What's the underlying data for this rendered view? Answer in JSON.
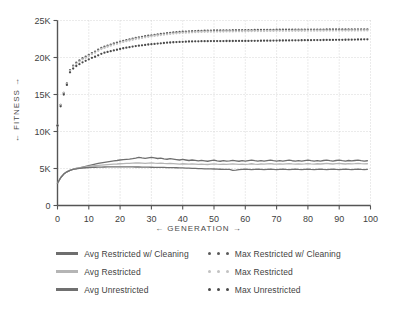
{
  "chart_data": {
    "type": "line",
    "title": "",
    "xlabel": "← GENERATION →",
    "ylabel": "← FITNESS →",
    "xlim": [
      0,
      100
    ],
    "ylim": [
      0,
      25000
    ],
    "xticks": [
      0,
      10,
      20,
      30,
      40,
      50,
      60,
      70,
      80,
      90,
      100
    ],
    "xticklabels": [
      "0",
      "10",
      "20",
      "30",
      "40",
      "50",
      "60",
      "70",
      "80",
      "90",
      "100"
    ],
    "yticks": [
      0,
      5000,
      10000,
      15000,
      20000,
      25000
    ],
    "yticklabels": [
      "0",
      "5K",
      "10K",
      "15K",
      "20K",
      "25K"
    ],
    "grid": true,
    "grid_style": "dotted",
    "legend_position": "below",
    "legend_columns": 2,
    "x": [
      0,
      1,
      2,
      3,
      4,
      5,
      6,
      7,
      8,
      9,
      10,
      11,
      12,
      13,
      14,
      15,
      16,
      17,
      18,
      19,
      20,
      21,
      22,
      23,
      24,
      25,
      26,
      27,
      28,
      29,
      30,
      31,
      32,
      33,
      34,
      35,
      36,
      37,
      38,
      39,
      40,
      41,
      42,
      43,
      44,
      45,
      46,
      47,
      48,
      49,
      50,
      51,
      52,
      53,
      54,
      55,
      56,
      57,
      58,
      59,
      60,
      61,
      62,
      63,
      64,
      65,
      66,
      67,
      68,
      69,
      70,
      71,
      72,
      73,
      74,
      75,
      76,
      77,
      78,
      79,
      80,
      81,
      82,
      83,
      84,
      85,
      86,
      87,
      88,
      89,
      90,
      91,
      92,
      93,
      94,
      95,
      96,
      97,
      98,
      99
    ],
    "series": [
      {
        "name": "Avg Restricted w/ Cleaning",
        "style": "solid",
        "color": "#6e6e6e",
        "values": [
          3000,
          3750,
          4250,
          4550,
          4750,
          4900,
          5000,
          5100,
          5200,
          5300,
          5400,
          5500,
          5600,
          5680,
          5760,
          5840,
          5900,
          5960,
          6020,
          6080,
          6150,
          6200,
          6240,
          6280,
          6330,
          6400,
          6500,
          6430,
          6380,
          6440,
          6500,
          6430,
          6350,
          6400,
          6300,
          6250,
          6320,
          6260,
          6200,
          6150,
          6220,
          6150,
          6080,
          6150,
          6090,
          6030,
          6110,
          6040,
          5980,
          6050,
          6120,
          6040,
          5980,
          6060,
          5990,
          6040,
          6110,
          6040,
          5980,
          6060,
          6000,
          6060,
          6120,
          6050,
          5990,
          6060,
          6000,
          6070,
          6120,
          6050,
          5990,
          6060,
          6010,
          6070,
          6120,
          6050,
          6000,
          6070,
          6010,
          6070,
          6130,
          6060,
          6000,
          6070,
          6010,
          6080,
          6130,
          6060,
          6010,
          6080,
          6130,
          6060,
          6010,
          6080,
          6020,
          6080,
          6130,
          6060,
          6010,
          6050
        ]
      },
      {
        "name": "Avg Restricted",
        "style": "solid",
        "color": "#b5b5b5",
        "values": [
          3000,
          3750,
          4250,
          4550,
          4750,
          4900,
          5000,
          5080,
          5160,
          5230,
          5290,
          5340,
          5380,
          5420,
          5460,
          5500,
          5530,
          5560,
          5590,
          5610,
          5640,
          5660,
          5680,
          5700,
          5720,
          5740,
          5760,
          5730,
          5700,
          5730,
          5760,
          5720,
          5690,
          5720,
          5680,
          5650,
          5690,
          5660,
          5630,
          5600,
          5640,
          5610,
          5580,
          5620,
          5590,
          5560,
          5600,
          5570,
          5540,
          5580,
          5620,
          5580,
          5550,
          5590,
          5560,
          5590,
          5630,
          5590,
          5560,
          5600,
          5570,
          5600,
          5640,
          5600,
          5570,
          5610,
          5580,
          5620,
          5650,
          5610,
          5580,
          5620,
          5590,
          5630,
          5660,
          5620,
          5590,
          5630,
          5600,
          5630,
          5670,
          5630,
          5600,
          5640,
          5610,
          5640,
          5680,
          5640,
          5610,
          5650,
          5680,
          5640,
          5610,
          5650,
          5620,
          5650,
          5690,
          5650,
          5620,
          5640
        ]
      },
      {
        "name": "Avg Unrestricted",
        "style": "solid",
        "color": "#707070",
        "values": [
          3000,
          3750,
          4250,
          4550,
          4750,
          4880,
          4960,
          5020,
          5070,
          5100,
          5130,
          5150,
          5170,
          5180,
          5190,
          5200,
          5210,
          5210,
          5220,
          5220,
          5230,
          5230,
          5220,
          5210,
          5210,
          5200,
          5200,
          5190,
          5180,
          5180,
          5170,
          5160,
          5150,
          5150,
          5140,
          5130,
          5120,
          5110,
          5100,
          5090,
          5080,
          5060,
          5050,
          5030,
          5010,
          4990,
          4980,
          4960,
          4950,
          4940,
          4930,
          4910,
          4900,
          4890,
          4880,
          4870,
          4750,
          4790,
          4850,
          4880,
          4900,
          4880,
          4860,
          4890,
          4900,
          4880,
          4860,
          4890,
          4910,
          4880,
          4860,
          4890,
          4910,
          4880,
          4860,
          4890,
          4910,
          4880,
          4860,
          4890,
          4910,
          4880,
          4860,
          4890,
          4910,
          4880,
          4860,
          4890,
          4910,
          4880,
          4860,
          4890,
          4910,
          4880,
          4860,
          4890,
          4910,
          4880,
          4860,
          4880
        ]
      },
      {
        "name": "Max Restricted w/ Cleaning",
        "style": "dotted",
        "color": "#5a5a5a",
        "values": [
          10800,
          13600,
          15200,
          16500,
          18300,
          18900,
          19300,
          19600,
          19900,
          20100,
          20350,
          20600,
          20800,
          21050,
          21300,
          21450,
          21600,
          21750,
          21900,
          22000,
          22150,
          22250,
          22350,
          22450,
          22550,
          22650,
          22720,
          22800,
          22880,
          22950,
          23000,
          23060,
          23120,
          23180,
          23230,
          23280,
          23330,
          23380,
          23420,
          23450,
          23480,
          23510,
          23530,
          23550,
          23570,
          23590,
          23610,
          23620,
          23630,
          23640,
          23650,
          23655,
          23660,
          23665,
          23670,
          23675,
          23680,
          23685,
          23690,
          23695,
          23700,
          23705,
          23710,
          23715,
          23720,
          23725,
          23730,
          23735,
          23740,
          23745,
          23750,
          23752,
          23754,
          23756,
          23758,
          23760,
          23762,
          23764,
          23766,
          23768,
          23770,
          23772,
          23774,
          23776,
          23778,
          23780,
          23782,
          23784,
          23786,
          23788,
          23790,
          23792,
          23794,
          23796,
          23798,
          23800,
          23802,
          23804,
          23806,
          23808
        ]
      },
      {
        "name": "Max Restricted",
        "style": "dotted",
        "color": "#c2c2c2",
        "values": [
          10800,
          13600,
          15200,
          16400,
          18200,
          18750,
          19150,
          19450,
          19750,
          19950,
          20200,
          20450,
          20650,
          20900,
          21150,
          21300,
          21450,
          21600,
          21750,
          21850,
          22000,
          22100,
          22200,
          22300,
          22400,
          22500,
          22570,
          22650,
          22730,
          22800,
          22850,
          22910,
          22970,
          23030,
          23080,
          23130,
          23180,
          23230,
          23270,
          23300,
          23330,
          23360,
          23380,
          23400,
          23420,
          23440,
          23460,
          23470,
          23480,
          23490,
          23500,
          23505,
          23510,
          23515,
          23520,
          23525,
          23530,
          23535,
          23540,
          23545,
          23550,
          23555,
          23560,
          23565,
          23570,
          23575,
          23580,
          23585,
          23590,
          23595,
          23600,
          23602,
          23604,
          23606,
          23608,
          23610,
          23612,
          23614,
          23616,
          23618,
          23620,
          23622,
          23624,
          23626,
          23628,
          23630,
          23632,
          23634,
          23636,
          23638,
          23640,
          23642,
          23644,
          23646,
          23648,
          23650,
          23652,
          23654,
          23656,
          23658
        ]
      },
      {
        "name": "Max Unrestricted",
        "style": "dotted",
        "color": "#4a4a4a",
        "values": [
          10800,
          13400,
          15000,
          16300,
          18000,
          18500,
          18850,
          19100,
          19350,
          19550,
          19750,
          19950,
          20100,
          20300,
          20500,
          20650,
          20750,
          20850,
          20950,
          21050,
          21150,
          21250,
          21330,
          21400,
          21480,
          21550,
          21600,
          21650,
          21700,
          21760,
          21800,
          21840,
          21880,
          21920,
          21960,
          22000,
          22030,
          22060,
          22080,
          22100,
          22120,
          22140,
          22160,
          22170,
          22180,
          22190,
          22200,
          22205,
          22210,
          22215,
          22220,
          22222,
          22224,
          22226,
          22228,
          22230,
          22232,
          22234,
          22236,
          22238,
          22240,
          22245,
          22250,
          22255,
          22260,
          22265,
          22270,
          22275,
          22280,
          22285,
          22290,
          22295,
          22300,
          22305,
          22310,
          22315,
          22320,
          22325,
          22330,
          22335,
          22340,
          22345,
          22350,
          22355,
          22360,
          22365,
          22370,
          22375,
          22380,
          22385,
          22390,
          22395,
          22400,
          22405,
          22410,
          22420,
          22430,
          22440,
          22450,
          22460
        ]
      }
    ]
  },
  "legend": {
    "entries": [
      {
        "label": "Avg Restricted w/ Cleaning",
        "style": "solid",
        "color": "#6e6e6e"
      },
      {
        "label": "Max Restricted w/ Cleaning",
        "style": "dotted",
        "color": "#5a5a5a"
      },
      {
        "label": "Avg Restricted",
        "style": "solid",
        "color": "#b5b5b5"
      },
      {
        "label": "Max Restricted",
        "style": "dotted",
        "color": "#c2c2c2"
      },
      {
        "label": "Avg Unrestricted",
        "style": "solid",
        "color": "#707070"
      },
      {
        "label": "Max Unrestricted",
        "style": "dotted",
        "color": "#4a4a4a"
      }
    ]
  },
  "colors": {
    "background": "#ffffff",
    "axis": "#555555",
    "grid": "#cccccc",
    "text": "#3f3f3f"
  }
}
